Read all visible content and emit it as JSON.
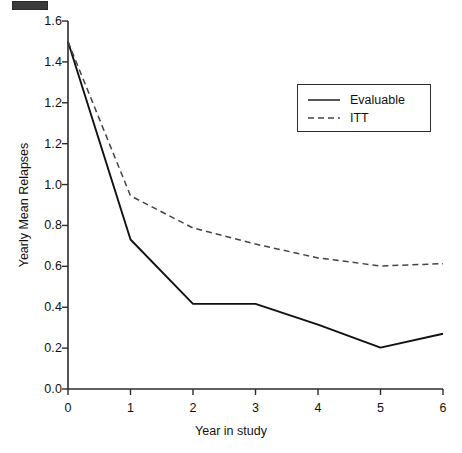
{
  "chart_data": {
    "type": "line",
    "title": "",
    "xlabel": "Year in study",
    "ylabel": "Yearly Mean Relapses",
    "x": [
      0,
      1,
      2,
      3,
      4,
      5,
      6
    ],
    "xlim": [
      0,
      6
    ],
    "ylim": [
      0.0,
      1.6
    ],
    "xticks": [
      "0",
      "1",
      "2",
      "3",
      "4",
      "5",
      "6"
    ],
    "yticks": [
      "1.6",
      "1.4",
      "1.2",
      "1.2",
      "1.0",
      "0.8",
      "0.6",
      "0.4",
      "0.2",
      "0.0"
    ],
    "ytick_values": [
      1.6,
      1.4,
      1.2,
      1.1,
      1.0,
      0.8,
      0.6,
      0.4,
      0.2,
      0.0
    ],
    "grid": false,
    "legend_position": "upper right",
    "series": [
      {
        "name": "Evaluable",
        "style": "solid",
        "color": "#111111",
        "values": [
          1.51,
          0.65,
          0.37,
          0.37,
          0.28,
          0.18,
          0.24
        ]
      },
      {
        "name": "ITT",
        "style": "dashed",
        "color": "#444444",
        "values": [
          1.51,
          0.84,
          0.7,
          0.63,
          0.57,
          0.535,
          0.545
        ]
      }
    ]
  },
  "axes": {
    "y_title": "Yearly Mean Relapses",
    "x_title": "Year in study",
    "y_tick_labels": [
      "1.6",
      "1.4",
      "1.2",
      "1.2",
      "1.0",
      "0.8",
      "0.6",
      "0.4",
      "0.2",
      "0.0"
    ],
    "x_tick_labels": [
      "0",
      "1",
      "2",
      "3",
      "4",
      "5",
      "6"
    ]
  },
  "legend": {
    "entries": [
      {
        "label": "Evaluable",
        "style": "solid"
      },
      {
        "label": "ITT",
        "style": "dashed"
      }
    ]
  },
  "colors": {
    "line_evaluable": "#111111",
    "line_itt": "#444444",
    "axis": "#2b2b2b",
    "background": "#ffffff"
  }
}
